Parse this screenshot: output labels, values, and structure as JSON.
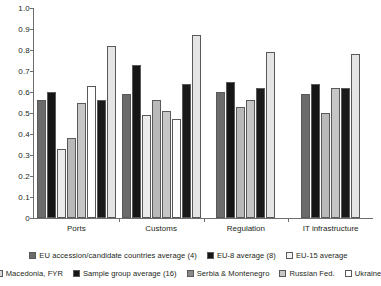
{
  "chart_data": {
    "type": "bar",
    "title": "",
    "subtitle": "",
    "xlabel": "",
    "ylabel": "",
    "ylim": [
      0,
      1.0
    ],
    "ytick_labels": [
      "1.0",
      "0.9",
      "0.8",
      "0.7",
      "0.6",
      "0.5",
      "0.4",
      "0.3",
      "0.2",
      "0.1",
      "0"
    ],
    "ytick_values": [
      1.0,
      0.9,
      0.8,
      0.7,
      0.6,
      0.5,
      0.4,
      0.3,
      0.2,
      0.1,
      0
    ],
    "grid": false,
    "legend_position": "bottom",
    "categories": [
      "Ports",
      "Customs",
      "Regulation",
      "IT infrastructure"
    ],
    "series": [
      {
        "name": "EU accession/candidate countries average (4)",
        "color": "#6b6b6b",
        "values": [
          0.56,
          0.59,
          0.6,
          0.59
        ]
      },
      {
        "name": "EU-8 average (8)",
        "color": "#161616",
        "values": [
          0.6,
          0.73,
          0.65,
          0.64
        ]
      },
      {
        "name": "EU-15 average",
        "color": "#ececec",
        "values": [
          0.33,
          0.49,
          null,
          null
        ]
      },
      {
        "name": "Macedonia, FYR",
        "color": "#b9b9b9",
        "values": [
          0.38,
          0.56,
          0.53,
          0.5
        ]
      },
      {
        "name": "Sample group average (16)",
        "color": "#c6c6c6",
        "values": [
          0.55,
          0.51,
          0.56,
          0.62
        ]
      },
      {
        "name": "Serbia & Montenegro",
        "color": "#fdfdfd",
        "values": [
          0.63,
          0.47,
          null,
          null
        ]
      },
      {
        "name": "Russian Fed.",
        "color": "#1a1a1a",
        "values": [
          0.56,
          0.64,
          0.62,
          0.62
        ]
      },
      {
        "name": "Ukraine",
        "color": "#e4e4e4",
        "values": [
          0.82,
          0.87,
          0.79,
          0.78
        ]
      }
    ]
  },
  "legend": {
    "rows": [
      [
        {
          "label": "EU accession/candidate countries average (4)",
          "color": "#6b6b6b"
        },
        {
          "label": "EU-8 average (8)",
          "color": "#161616"
        },
        {
          "label": "EU-15 average",
          "color": "#f4f4f4"
        }
      ],
      [
        {
          "label": "Macedonia, FYR",
          "color": "#d8d8d8"
        },
        {
          "label": "Sample group average (16)",
          "color": "#161616"
        },
        {
          "label": "Serbia & Montenegro",
          "color": "#8a8a8a"
        },
        {
          "label": "Russian Fed.",
          "color": "#c6c6c6"
        },
        {
          "label": "Ukraine",
          "color": "#ffffff"
        }
      ]
    ]
  }
}
